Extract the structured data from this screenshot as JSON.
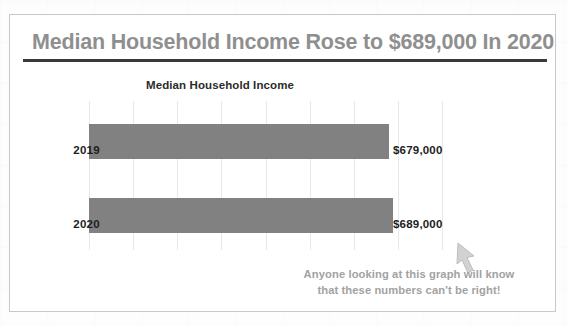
{
  "slide": {
    "title": "Median Household Income Rose to $689,000 In 2020",
    "title_color": "#8f8f8f",
    "rule_color": "#3a3a3a",
    "annotation": {
      "line1": "Anyone looking at this graph will know",
      "line2": "that these numbers can't be right!",
      "color": "#a2a2a2"
    },
    "cursor_icon": "mouse-cursor-arrow-icon"
  },
  "chart_data": {
    "type": "bar",
    "orientation": "horizontal",
    "title": "Median Household Income",
    "categories": [
      "2019",
      "2020"
    ],
    "values": [
      679000,
      689000
    ],
    "value_labels": [
      "$679,000",
      "$689,000"
    ],
    "xlabel": "",
    "ylabel": "",
    "xlim": [
      0,
      800000
    ],
    "grid": true,
    "grid_axis": "x",
    "gridline_count": 9,
    "legend": false,
    "bar_color": "#818181",
    "gridline_color": "#e8e8e8",
    "series": [
      {
        "name": "Median Household Income",
        "values": [
          679000,
          689000
        ]
      }
    ]
  }
}
